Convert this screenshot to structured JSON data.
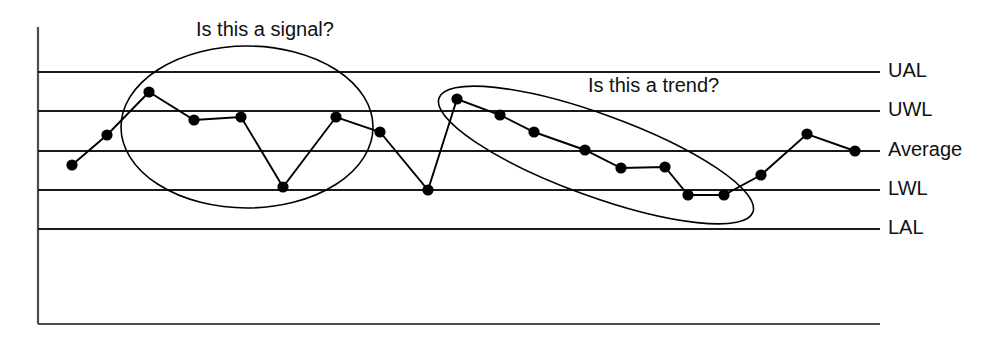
{
  "chart_data": {
    "type": "line",
    "title": "",
    "subtitle": "",
    "xlabel": "",
    "ylabel": "",
    "grid": false,
    "legend_position": "right",
    "axis": {
      "x_start_px": 38,
      "x_end_px": 880,
      "y_top_px": 27,
      "y_bottom_px": 324,
      "x_range_label": "",
      "y_range_label": ""
    },
    "control_limits": [
      {
        "key": "UAL",
        "label": "UAL",
        "y_px": 72,
        "value": 5
      },
      {
        "key": "UWL",
        "label": "UWL",
        "y_px": 111,
        "value": 4
      },
      {
        "key": "Average",
        "label": "Average",
        "y_px": 151,
        "value": 3
      },
      {
        "key": "LWL",
        "label": "LWL",
        "y_px": 190,
        "value": 2
      },
      {
        "key": "LAL",
        "label": "LAL",
        "y_px": 229,
        "value": 1
      }
    ],
    "series": [
      {
        "name": "measurement",
        "marker": "filled-circle",
        "marker_color": "#000000",
        "line_color": "#000000",
        "points": [
          {
            "i": 1,
            "x_px": 72,
            "y_px": 165,
            "value": 2.65
          },
          {
            "i": 2,
            "x_px": 107,
            "y_px": 135,
            "value": 3.41
          },
          {
            "i": 3,
            "x_px": 149,
            "y_px": 92,
            "value": 4.49
          },
          {
            "i": 4,
            "x_px": 194,
            "y_px": 120,
            "value": 3.78
          },
          {
            "i": 5,
            "x_px": 241,
            "y_px": 117,
            "value": 3.85
          },
          {
            "i": 6,
            "x_px": 283,
            "y_px": 187,
            "value": 2.08
          },
          {
            "i": 7,
            "x_px": 336,
            "y_px": 117,
            "value": 3.85
          },
          {
            "i": 8,
            "x_px": 380,
            "y_px": 132,
            "value": 3.48
          },
          {
            "i": 9,
            "x_px": 428,
            "y_px": 190,
            "value": 2.0
          },
          {
            "i": 10,
            "x_px": 457,
            "y_px": 99,
            "value": 4.31
          },
          {
            "i": 11,
            "x_px": 500,
            "y_px": 115,
            "value": 3.91
          },
          {
            "i": 12,
            "x_px": 534,
            "y_px": 132,
            "value": 3.48
          },
          {
            "i": 13,
            "x_px": 585,
            "y_px": 150,
            "value": 3.03
          },
          {
            "i": 14,
            "x_px": 621,
            "y_px": 168,
            "value": 2.57
          },
          {
            "i": 15,
            "x_px": 665,
            "y_px": 167,
            "value": 2.6
          },
          {
            "i": 16,
            "x_px": 688,
            "y_px": 195,
            "value": 1.87
          },
          {
            "i": 17,
            "x_px": 724,
            "y_px": 195,
            "value": 1.87
          },
          {
            "i": 18,
            "x_px": 761,
            "y_px": 175,
            "value": 2.38
          },
          {
            "i": 19,
            "x_px": 807,
            "y_px": 134,
            "value": 3.43
          },
          {
            "i": 20,
            "x_px": 855,
            "y_px": 151,
            "value": 3.0
          }
        ]
      }
    ],
    "annotations": [
      {
        "id": "signal",
        "text": "Is this a signal?",
        "text_x_px": 196,
        "text_y_px": 36,
        "highlight": {
          "shape": "ellipse",
          "cx_px": 247,
          "cy_px": 127,
          "rx_px": 126,
          "ry_px": 81,
          "rotation_deg": 0
        }
      },
      {
        "id": "trend",
        "text": "Is this a trend?",
        "text_x_px": 588,
        "text_y_px": 92,
        "highlight": {
          "shape": "ellipse",
          "cx_px": 596,
          "cy_px": 155,
          "rx_px": 167,
          "ry_px": 41,
          "rotation_deg": 20
        }
      }
    ],
    "legend": {
      "entries": [
        {
          "label": "UAL",
          "marker": "line"
        },
        {
          "label": "UWL",
          "marker": "line"
        },
        {
          "label": "Average",
          "marker": "line-with-dot"
        },
        {
          "label": "LWL",
          "marker": "line"
        },
        {
          "label": "LAL",
          "marker": "line"
        }
      ]
    },
    "colors": {
      "line": "#000000",
      "marker": "#000000",
      "limit_line": "#1a1a1a",
      "axis": "#4d4d4d",
      "text": "#111111",
      "background": "#ffffff"
    }
  }
}
